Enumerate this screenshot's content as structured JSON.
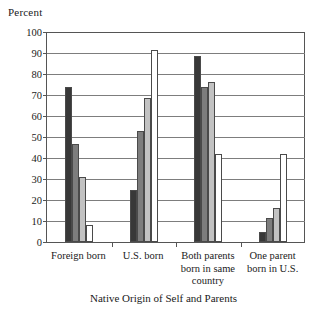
{
  "chart_data": {
    "type": "bar",
    "title": "",
    "xlabel": "Native Origin of Self and Parents",
    "ylabel": "Percent",
    "ylim": [
      0,
      100
    ],
    "yticks": [
      0,
      10,
      20,
      30,
      40,
      50,
      60,
      70,
      80,
      90,
      100
    ],
    "grid": true,
    "legend_position": "none",
    "categories": [
      "Foreign born",
      "U.S. born",
      "Both parents born in same country",
      "One parent born in U.S."
    ],
    "category_lines": [
      [
        "Foreign born"
      ],
      [
        "U.S. born"
      ],
      [
        "Both parents",
        "born in same",
        "country"
      ],
      [
        "One parent",
        "born in U.S."
      ]
    ],
    "series": [
      {
        "name": "series-1",
        "color": "#383838",
        "values": [
          74,
          25,
          88.5,
          5
        ]
      },
      {
        "name": "series-2",
        "color": "#7d7d7d",
        "values": [
          46.5,
          53,
          74,
          11.5
        ]
      },
      {
        "name": "series-3",
        "color": "#c2c2c2",
        "values": [
          31,
          68.5,
          76,
          16
        ]
      },
      {
        "name": "series-4",
        "color": "#ffffff",
        "values": [
          8,
          91.5,
          42,
          42
        ]
      }
    ],
    "colors": {
      "axis": "#555555",
      "gridline": "#7d7d7d",
      "bar_outline": "#4a4a4a",
      "text": "#1a1a1a",
      "background": "#ffffff"
    }
  }
}
